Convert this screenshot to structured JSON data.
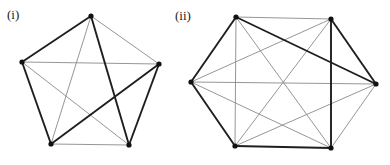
{
  "figures": [
    {
      "label": "(i)",
      "shape": "pentagon (complete graph K5)",
      "vertices": {
        "top": [
          91,
          16
        ],
        "left": [
          22,
          62
        ],
        "right": [
          159,
          64
        ],
        "bottom_left": [
          51,
          144
        ],
        "bottom_right": [
          129,
          145
        ]
      },
      "thick_edges": [
        [
          "top",
          "left"
        ],
        [
          "left",
          "bottom_left"
        ],
        [
          "bottom_left",
          "right"
        ],
        [
          "right",
          "bottom_right"
        ],
        [
          "bottom_right",
          "top"
        ]
      ],
      "thin_edges": [
        [
          "top",
          "right"
        ],
        [
          "left",
          "right"
        ],
        [
          "top",
          "bottom_left"
        ],
        [
          "left",
          "bottom_right"
        ],
        [
          "bottom_left",
          "bottom_right"
        ]
      ]
    },
    {
      "label": "(ii)",
      "shape": "hexagon (complete graph K6)",
      "vertices": {
        "top_left": [
          236,
          17
        ],
        "top_right": [
          331,
          19
        ],
        "right": [
          376,
          84
        ],
        "bottom_right": [
          331,
          148
        ],
        "bottom_left": [
          235,
          146
        ],
        "left": [
          191,
          82
        ]
      },
      "thick_edges": [
        [
          "top_left",
          "left"
        ],
        [
          "left",
          "bottom_left"
        ],
        [
          "bottom_left",
          "bottom_right"
        ],
        [
          "bottom_right",
          "top_right"
        ],
        [
          "top_right",
          "right"
        ],
        [
          "top_left",
          "right"
        ]
      ],
      "thin_edges": [
        [
          "top_left",
          "top_right"
        ],
        [
          "right",
          "bottom_right"
        ],
        [
          "top_left",
          "bottom_left"
        ],
        [
          "top_left",
          "bottom_right"
        ],
        [
          "top_right",
          "left"
        ],
        [
          "top_right",
          "bottom_left"
        ],
        [
          "right",
          "left"
        ],
        [
          "right",
          "bottom_left"
        ],
        [
          "bottom_right",
          "left"
        ]
      ]
    }
  ],
  "colors": {
    "thick": "#1e1e1e",
    "thin": "#8a8a8a",
    "vertex": "#111111"
  }
}
